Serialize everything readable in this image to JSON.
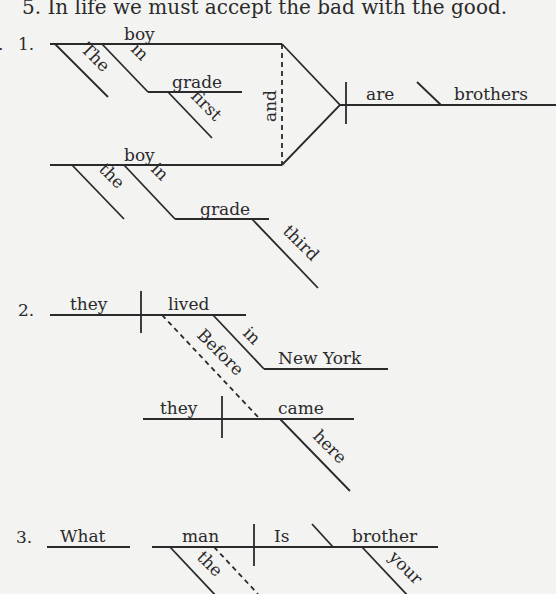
{
  "header": {
    "text": "5.  In life we must accept the bad with the good."
  },
  "diagrams": [
    {
      "number": "1.",
      "sentence_words": {
        "subject_1": "boy",
        "subject_1_article": "The",
        "subject_1_prep": "in",
        "subject_1_prep_object": "grade",
        "subject_1_prep_object_modifier": "first",
        "conjunction": "and",
        "subject_2": "boy",
        "subject_2_article": "the",
        "subject_2_prep": "in",
        "subject_2_prep_object": "grade",
        "subject_2_prep_object_modifier": "third",
        "verb": "are",
        "complement": "brothers"
      }
    },
    {
      "number": "2.",
      "sentence_words": {
        "subject": "they",
        "verb": "lived",
        "prep": "in",
        "prep_object": "New York",
        "subordinator": "Before",
        "clause_subject": "they",
        "clause_verb": "came",
        "clause_adverb": "here"
      }
    },
    {
      "number": "3.",
      "sentence_words": {
        "interrogative": "What",
        "subject": "man",
        "subject_article": "the",
        "verb": "Is",
        "complement": "brother",
        "complement_modifier": "your"
      }
    }
  ]
}
